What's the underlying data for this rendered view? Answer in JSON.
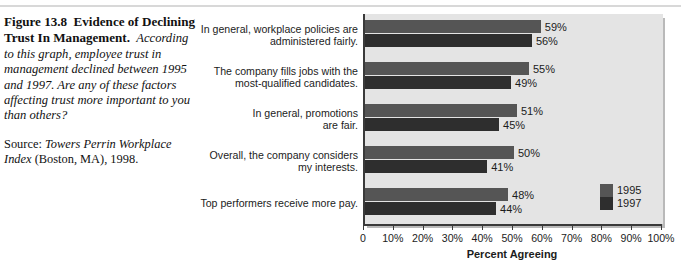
{
  "figure": {
    "label": "Figure 13.8",
    "title": "Evidence of Declining Trust In Management.",
    "caption": "According to this graph, employee trust in management declined between 1995 and 1997. Are any of these factors affecting trust more important to you than others?",
    "source_prefix": "Source:",
    "source_italic": "Towers Perrin Workplace Index",
    "source_rest": "(Boston, MA), 1998."
  },
  "chart_data": {
    "type": "bar",
    "orientation": "horizontal",
    "title": "",
    "xlabel": "Percent Agreeing",
    "ylabel": "",
    "xlim": [
      0,
      100
    ],
    "xticks": [
      0,
      10,
      20,
      30,
      40,
      50,
      60,
      70,
      80,
      90,
      100
    ],
    "xtick_labels": [
      "0",
      "10%",
      "20%",
      "30%",
      "40%",
      "50%",
      "60%",
      "70%",
      "80%",
      "90%",
      "100%"
    ],
    "grid": false,
    "legend_position": "inside-bottom-right",
    "categories": [
      "In general, workplace policies are administered fairly.",
      "The company fills jobs with the most-qualified candidates.",
      "In general, promotions are fair.",
      "Overall, the company considers my interests.",
      "Top performers receive more pay."
    ],
    "category_lines": [
      [
        "In general, workplace policies are",
        "administered fairly."
      ],
      [
        "The company fills jobs with the",
        "most-qualified candidates."
      ],
      [
        "In general, promotions",
        "are fair."
      ],
      [
        "Overall, the company considers",
        "my interests."
      ],
      [
        "Top performers receive more pay."
      ]
    ],
    "series": [
      {
        "name": "1995",
        "color": "#555555",
        "values": [
          59,
          55,
          51,
          50,
          48
        ],
        "value_labels": [
          "59%",
          "55%",
          "51%",
          "50%",
          "48%"
        ]
      },
      {
        "name": "1997",
        "color": "#2e2e2e",
        "values": [
          56,
          49,
          45,
          41,
          44
        ],
        "value_labels": [
          "56%",
          "49%",
          "45%",
          "41%",
          "44%"
        ]
      }
    ]
  }
}
